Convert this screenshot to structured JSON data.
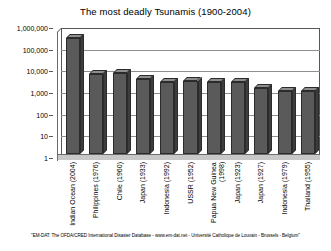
{
  "chart_data": {
    "type": "bar",
    "title": "The most deadly Tsunamis (1900-2004)",
    "xlabel": "",
    "ylabel": "",
    "yscale": "log",
    "ylim": [
      1,
      1000000
    ],
    "grid": true,
    "legend": false,
    "categories": [
      "Indian Ocean (2004)",
      "Philippines (1976)",
      "Chile (1960)",
      "Japan (1933)",
      "Indonesia (1992)",
      "USSR (1952)",
      "Papua New Guinea (1998)",
      "Japan (1923)",
      "Japan (1927)",
      "Indonesia (1979)",
      "Thailand (1955)"
    ],
    "values": [
      226000,
      5000,
      5700,
      3000,
      2200,
      2336,
      2182,
      2144,
      1100,
      800,
      800
    ],
    "ytick_labels": [
      "1,000,000",
      "100,000",
      "10,000",
      "1,000",
      "100",
      "10",
      "1"
    ],
    "ytick_values": [
      1000000,
      100000,
      10000,
      1000,
      100,
      10,
      1
    ]
  },
  "source_note": "\"EM-DAT: The OFDA/CRED International Disaster Database - www.em-dat.net - Université Catholique de Louvain - Brussels - Belgium\""
}
